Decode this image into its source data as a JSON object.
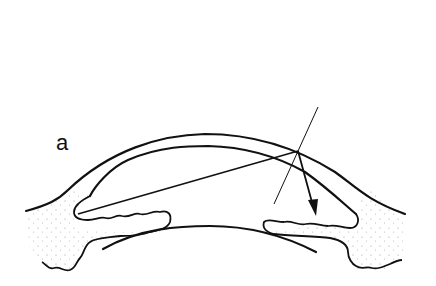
{
  "figure": {
    "panel_label": "a",
    "colors": {
      "ink": "#111111",
      "stipple": "#9a9a9a",
      "background": "#ffffff"
    }
  }
}
